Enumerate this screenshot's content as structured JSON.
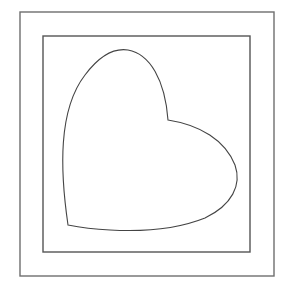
{
  "figure": {
    "colors": {
      "background": "#ffffff",
      "outer_frame": "#6e6e6e",
      "inner_frame": "#555555",
      "heart_stroke": "#444444"
    },
    "outer_frame": {
      "x": 20,
      "y": 12,
      "width": 254,
      "height": 264
    },
    "inner_frame": {
      "x": 43,
      "y": 36,
      "width": 207,
      "height": 216
    },
    "heart": {
      "label": "heart-shape",
      "path": "M 68 225 C 60 170, 58 110, 85 75 C 100 55, 115 48, 128 50 C 150 54, 165 80, 168 120 C 200 125, 225 140, 235 165 C 242 185, 232 205, 205 218 C 180 228, 145 232, 110 230 C 90 229, 78 227, 68 225 Z"
    }
  }
}
